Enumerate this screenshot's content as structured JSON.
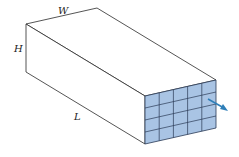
{
  "labels": {
    "width": "W",
    "height": "H",
    "length": "L"
  },
  "colors": {
    "edge": "#2a2a2a",
    "face": "#ffffff",
    "cell_fill": "#a9c4e4",
    "cell_line": "#2a3a55",
    "arrow": "#2f7fb8"
  },
  "grid": {
    "rows": 4,
    "cols": 5
  }
}
